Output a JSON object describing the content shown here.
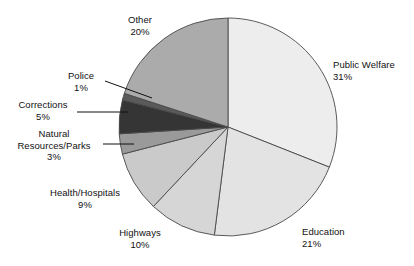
{
  "chart_data": {
    "type": "pie",
    "title": "",
    "subtitle": "",
    "xlabel": "",
    "ylabel": "",
    "legend_position": "none",
    "grid": false,
    "total": 100,
    "units": "percent",
    "start_angle_deg": 0,
    "direction": "clockwise",
    "categories": [
      "Public Welfare",
      "Education",
      "Highways",
      "Health/Hospitals",
      "Natural Resources/Parks",
      "Corrections",
      "Police",
      "Other"
    ],
    "values": [
      31,
      21,
      10,
      9,
      3,
      5,
      1,
      20
    ],
    "slices": [
      {
        "label": "Public Welfare",
        "value": 31,
        "pct_text": "31%",
        "color": "#ededed",
        "label_align": "left",
        "label_x": 333,
        "label_y": 59,
        "leader": false
      },
      {
        "label": "Education",
        "value": 21,
        "pct_text": "21%",
        "color": "#e3e3e3",
        "label_align": "left",
        "label_x": 302,
        "label_y": 226,
        "leader": false
      },
      {
        "label": "Highways",
        "value": 10,
        "pct_text": "10%",
        "color": "#d6d6d6",
        "label_align": "center",
        "label_x": 130,
        "label_y": 227,
        "leader": false
      },
      {
        "label": "Health/Hospitals",
        "value": 9,
        "pct_text": "9%",
        "color": "#cacaca",
        "label_align": "center",
        "label_x": 56,
        "label_y": 187,
        "leader": false
      },
      {
        "label": "Natural Resources/Parks",
        "label_line1": "Natural",
        "label_line2": "Resources/Parks",
        "value": 3,
        "pct_text": "3%",
        "color": "#9a9a9a",
        "label_align": "center",
        "label_x": 14,
        "label_y": 128,
        "leader": true
      },
      {
        "label": "Corrections",
        "value": 5,
        "pct_text": "5%",
        "color": "#353535",
        "label_align": "center",
        "label_x": 44,
        "label_y": 99,
        "leader": true
      },
      {
        "label": "Police",
        "value": 1,
        "pct_text": "1%",
        "color": "#5a5a5a",
        "label_align": "center",
        "label_x": 78,
        "label_y": 70,
        "leader": true
      },
      {
        "label": "Other",
        "value": 20,
        "pct_text": "20%",
        "color": "#ababab",
        "label_align": "center",
        "label_x": 139,
        "label_y": 14,
        "leader": false
      }
    ],
    "geometry": {
      "center_x": 228,
      "center_y": 127,
      "radius": 109,
      "stroke": "#4a4a4a",
      "stroke_width": 0.9
    },
    "leader_lines": [
      {
        "name": "police-leader",
        "x1": 105,
        "y1": 81,
        "x2": 152,
        "y2": 98
      },
      {
        "name": "corrections-leader",
        "x1": 77,
        "y1": 112,
        "x2": 128,
        "y2": 112
      },
      {
        "name": "natural-leader",
        "x1": 103,
        "y1": 144,
        "x2": 134,
        "y2": 144
      }
    ]
  }
}
